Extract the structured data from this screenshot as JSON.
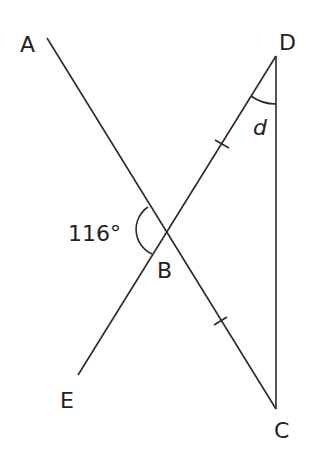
{
  "diagram": {
    "points": {
      "A": {
        "label": "A",
        "x": 47,
        "y": 38
      },
      "B": {
        "label": "B",
        "x": 166,
        "y": 232
      },
      "C": {
        "label": "C",
        "x": 276,
        "y": 409
      },
      "D": {
        "label": "D",
        "x": 276,
        "y": 56
      },
      "E": {
        "label": "E",
        "x": 78,
        "y": 375
      }
    },
    "segments": [
      [
        "A",
        "C"
      ],
      [
        "D",
        "E"
      ],
      [
        "D",
        "C"
      ]
    ],
    "equal_marks": [
      "DB",
      "BC"
    ],
    "angles": {
      "ABE": {
        "label": "116°",
        "at": "B"
      },
      "BDC": {
        "label": "d",
        "at": "D"
      }
    },
    "line_color": "#2a2a2a",
    "text_color": "#222222"
  }
}
